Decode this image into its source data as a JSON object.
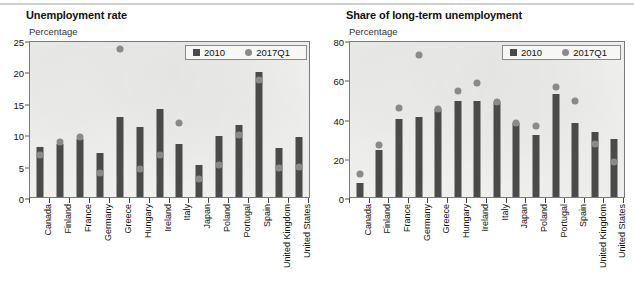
{
  "charts": [
    {
      "id": "unemployment-rate",
      "title": "Unemployment rate",
      "unit": "Percentage",
      "legend": [
        {
          "label": "2010",
          "marker": "square-marker",
          "color": "#4a4a4a"
        },
        {
          "label": "2017Q1",
          "marker": "circle-marker",
          "color": "#8a8a8a"
        }
      ],
      "yticks": [
        "0",
        "5",
        "10",
        "15",
        "20",
        "25"
      ]
    },
    {
      "id": "share-long-term-unemployment",
      "title": "Share of long-term unemployment",
      "unit": "Percentage",
      "legend": [
        {
          "label": "2010",
          "marker": "square-marker",
          "color": "#4a4a4a"
        },
        {
          "label": "2017Q1",
          "marker": "circle-marker",
          "color": "#8a8a8a"
        }
      ],
      "yticks": [
        "0",
        "20",
        "40",
        "60",
        "80"
      ]
    }
  ],
  "chart_data": [
    {
      "type": "bar",
      "title": "Unemployment rate",
      "xlabel": "",
      "ylabel": "Percentage",
      "ylim": [
        0,
        25
      ],
      "yticks": [
        0,
        5,
        10,
        15,
        20,
        25
      ],
      "grid": false,
      "legend_position": "top-right",
      "categories": [
        "Canada",
        "Finland",
        "France",
        "Germany",
        "Greece",
        "Hungary",
        "Ireland",
        "Italy",
        "Japan",
        "Poland",
        "Portugal",
        "Spain",
        "United Kingdom",
        "United States"
      ],
      "series": [
        {
          "name": "2010",
          "marker": "bar",
          "color": "#4a4a4a",
          "values": [
            8.0,
            8.4,
            9.3,
            7.0,
            12.7,
            11.2,
            14.0,
            8.4,
            5.1,
            9.7,
            11.4,
            19.9,
            7.8,
            9.6
          ]
        },
        {
          "name": "2017Q1",
          "marker": "dot",
          "color": "#8a8a8a",
          "values": [
            6.7,
            8.8,
            9.6,
            3.9,
            23.5,
            4.5,
            6.7,
            11.8,
            2.9,
            5.1,
            9.9,
            18.6,
            4.6,
            4.7
          ]
        }
      ]
    },
    {
      "type": "bar",
      "title": "Share of long-term unemployment",
      "xlabel": "",
      "ylabel": "Percentage",
      "ylim": [
        0,
        80
      ],
      "yticks": [
        0,
        20,
        40,
        60,
        80
      ],
      "grid": false,
      "legend_position": "top-right",
      "categories": [
        "Canada",
        "Finland",
        "France",
        "Germany",
        "Greece",
        "Hungary",
        "Ireland",
        "Italy",
        "Japan",
        "Poland",
        "Portugal",
        "Spain",
        "United Kingdom",
        "United States"
      ],
      "series": [
        {
          "name": "2010",
          "marker": "bar",
          "color": "#4a4a4a",
          "values": [
            6.9,
            24.0,
            40.0,
            41.0,
            45.0,
            49.0,
            49.0,
            48.5,
            37.5,
            31.5,
            52.5,
            37.5,
            33.0,
            29.5
          ]
        },
        {
          "name": "2017Q1",
          "marker": "dot",
          "color": "#8a8a8a",
          "values": [
            11.5,
            26.5,
            45.5,
            72.5,
            44.8,
            54.0,
            58.0,
            48.5,
            37.5,
            36.0,
            56.0,
            49.0,
            27.0,
            18.0
          ]
        }
      ]
    }
  ]
}
